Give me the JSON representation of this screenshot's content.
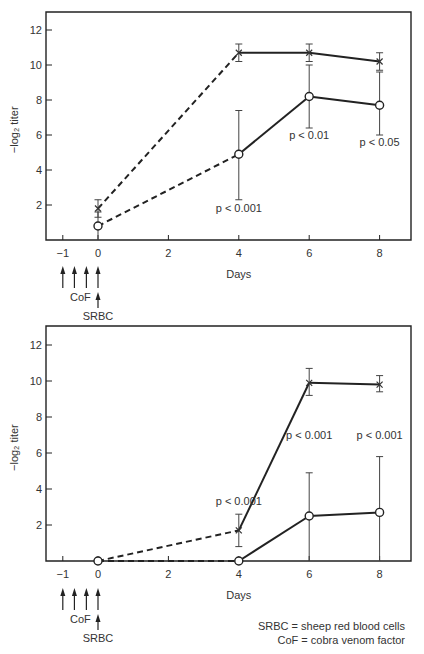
{
  "chart_data": [
    {
      "type": "line",
      "panel": "upper",
      "title": "",
      "xlabel": "Days",
      "ylabel": "−log₂ titer",
      "xlim": [
        -1.5,
        8.7
      ],
      "ylim": [
        0,
        13
      ],
      "xticks": [
        -1,
        0,
        2,
        4,
        6,
        8
      ],
      "xtick_labels": [
        "−1",
        "0",
        "2",
        "4",
        "6",
        "8"
      ],
      "yticks": [
        2,
        4,
        6,
        8,
        10,
        12
      ],
      "ytick_labels": [
        "2",
        "4",
        "6",
        "8",
        "10",
        "12"
      ],
      "grid": false,
      "series": [
        {
          "name": "SRBC",
          "marker": "x",
          "x": [
            0,
            4,
            6,
            8
          ],
          "values": [
            1.8,
            10.7,
            10.7,
            10.2
          ],
          "err_low": [
            1.3,
            10.2,
            10.2,
            9.7
          ],
          "err_high": [
            2.3,
            11.2,
            11.2,
            10.7
          ],
          "segments": [
            "dashed",
            "solid",
            "solid"
          ]
        },
        {
          "name": "CoF + SRBC",
          "marker": "o",
          "x": [
            0,
            4,
            6,
            8
          ],
          "values": [
            0.8,
            4.9,
            8.2,
            7.7
          ],
          "err_low": [
            0.0,
            2.3,
            6.4,
            6.0
          ],
          "err_high": [
            1.6,
            7.4,
            10.0,
            9.6
          ],
          "segments": [
            "dashed",
            "solid",
            "solid"
          ]
        }
      ],
      "annotations": [
        {
          "text": "p < 0.001",
          "x": 4,
          "y": 1.6
        },
        {
          "text": "p < 0.01",
          "x": 6,
          "y": 5.8
        },
        {
          "text": "p < 0.05",
          "x": 8,
          "y": 5.4
        }
      ],
      "treatment_arrows": {
        "cof_days": [
          -1,
          -0.67,
          -0.33,
          0
        ],
        "cof_label": "CoF",
        "srbc_day": 0,
        "srbc_label": "SRBC"
      }
    },
    {
      "type": "line",
      "panel": "lower",
      "title": "",
      "xlabel": "Days",
      "ylabel": "−log₂ titer",
      "xlim": [
        -1.5,
        8.7
      ],
      "ylim": [
        0,
        13
      ],
      "xticks": [
        -1,
        0,
        2,
        4,
        6,
        8
      ],
      "xtick_labels": [
        "−1",
        "0",
        "2",
        "4",
        "6",
        "8"
      ],
      "yticks": [
        2,
        4,
        6,
        8,
        10,
        12
      ],
      "ytick_labels": [
        "2",
        "4",
        "6",
        "8",
        "10",
        "12"
      ],
      "grid": false,
      "series": [
        {
          "name": "SRBC",
          "marker": "x",
          "x": [
            0,
            4,
            6,
            8
          ],
          "values": [
            0,
            1.7,
            9.9,
            9.8
          ],
          "err_low": [
            0,
            0.8,
            9.2,
            9.4
          ],
          "err_high": [
            0,
            2.6,
            10.7,
            10.3
          ],
          "segments": [
            "dashed",
            "solid",
            "solid"
          ]
        },
        {
          "name": "CoF + SRBC",
          "marker": "o",
          "x": [
            0,
            4,
            6,
            8
          ],
          "values": [
            0,
            0,
            2.5,
            2.7
          ],
          "err_low": [
            0,
            0,
            0,
            0
          ],
          "err_high": [
            0,
            0,
            4.9,
            5.8
          ],
          "segments": [
            "dashed",
            "solid",
            "solid"
          ]
        }
      ],
      "annotations": [
        {
          "text": "p < 0.001",
          "x": 4,
          "y": 3.1
        },
        {
          "text": "p < 0.001",
          "x": 6,
          "y": 6.8
        },
        {
          "text": "p < 0.001",
          "x": 8,
          "y": 6.8
        }
      ],
      "treatment_arrows": {
        "cof_days": [
          -1,
          -0.67,
          -0.33,
          0
        ],
        "cof_label": "CoF",
        "srbc_day": 0,
        "srbc_label": "SRBC"
      }
    }
  ],
  "legend": {
    "line1": "SRBC = sheep red blood cells",
    "line2": "CoF = cobra venom factor"
  }
}
